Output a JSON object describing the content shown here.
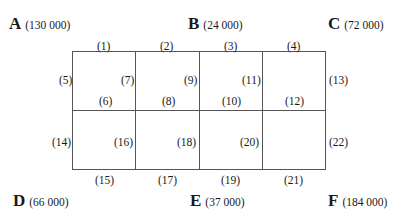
{
  "nodes": {
    "A": {
      "letter": "A",
      "value": "(130 000)"
    },
    "B": {
      "letter": "B",
      "value": "(24 000)"
    },
    "C": {
      "letter": "C",
      "value": "(72 000)"
    },
    "D": {
      "letter": "D",
      "value": "(66 000)"
    },
    "E": {
      "letter": "E",
      "value": "(37 000)"
    },
    "F": {
      "letter": "F",
      "value": "(184 000)"
    }
  },
  "edges": [
    "(1)",
    "(2)",
    "(3)",
    "(4)",
    "(5)",
    "(6)",
    "(7)",
    "(8)",
    "(9)",
    "(10)",
    "(11)",
    "(12)",
    "(13)",
    "(14)",
    "(15)",
    "(16)",
    "(17)",
    "(18)",
    "(19)",
    "(20)",
    "(21)",
    "(22)"
  ],
  "style": {
    "line_color": "#555555",
    "text_color": "#1a1a1a"
  }
}
